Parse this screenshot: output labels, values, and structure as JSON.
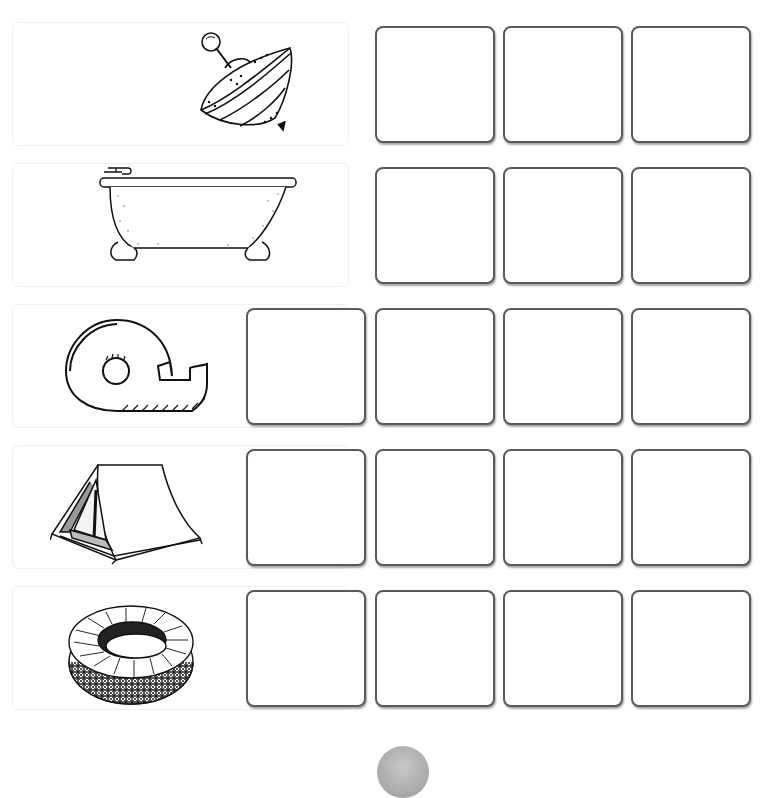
{
  "worksheet": {
    "rows": [
      {
        "picture": "spinning-top",
        "box_count": 3
      },
      {
        "picture": "bathtub",
        "box_count": 3
      },
      {
        "picture": "tape-dispenser",
        "box_count": 4
      },
      {
        "picture": "tent",
        "box_count": 4
      },
      {
        "picture": "tire",
        "box_count": 4
      }
    ],
    "colors": {
      "box_border": "#5a5a5a",
      "page_dot": "#aaaaaa"
    }
  }
}
